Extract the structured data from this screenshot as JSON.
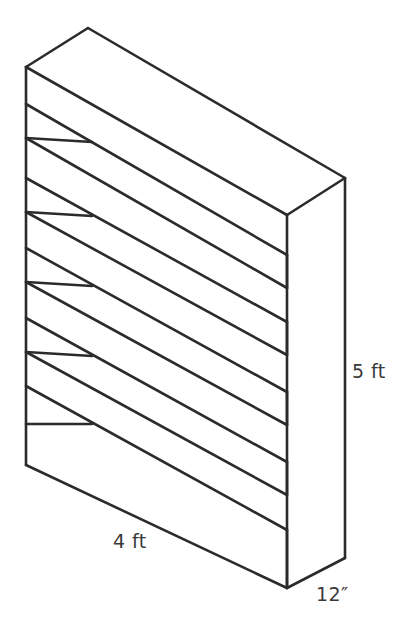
{
  "figure": {
    "object_name": "bookshelf",
    "background_color": "#ffffff",
    "line_color": "#2b2b2b",
    "text_color": "#3a3a3a",
    "shelf_count": 5
  },
  "dimensions": {
    "height": {
      "label": "5 ft",
      "measures": "height",
      "position": "right-side"
    },
    "width": {
      "label": "4 ft",
      "measures": "width",
      "position": "bottom-front"
    },
    "depth": {
      "label": "12″",
      "measures": "depth",
      "position": "bottom-right"
    }
  }
}
